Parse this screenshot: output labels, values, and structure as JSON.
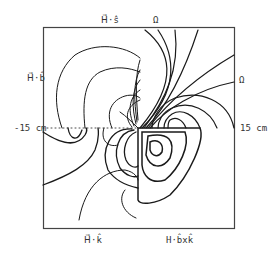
{
  "labels": {
    "top_left": "H⃗·ŝ",
    "top_right": "Ω",
    "left_top": "H⃗·b̂",
    "right_top": "Ω",
    "left_axis": "-15 cm",
    "right_axis": "15 cm",
    "bottom_left": "H⃗·k̂",
    "bottom_right": "H·b̂xk̂"
  },
  "colors": {
    "line": "#1a1a1a",
    "frame": "#444444"
  }
}
